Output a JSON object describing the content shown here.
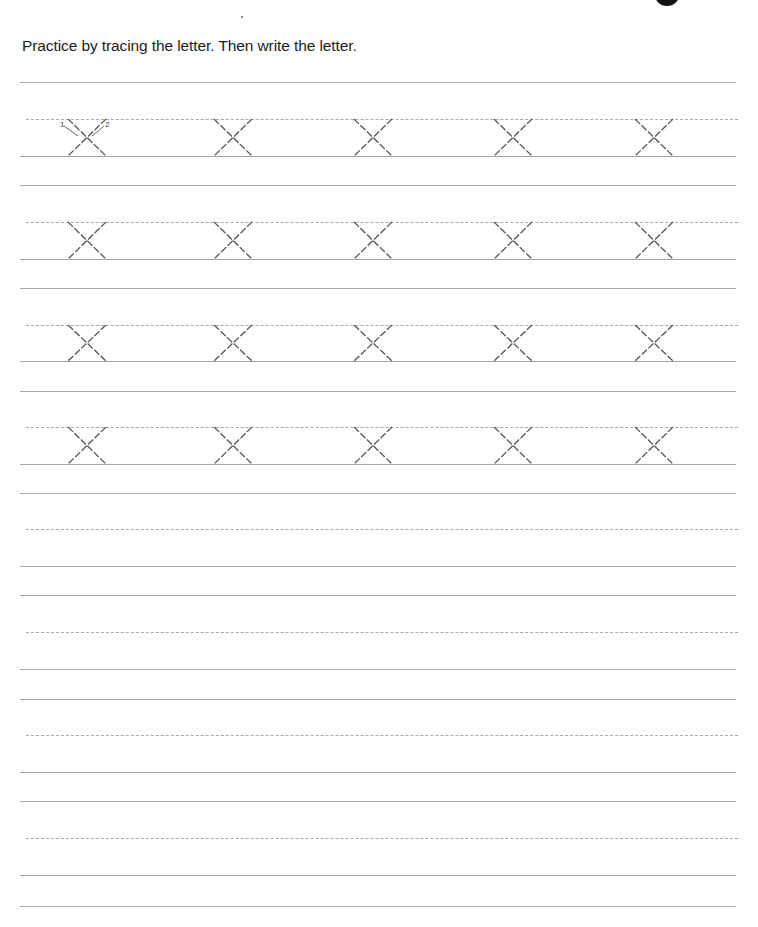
{
  "worksheet": {
    "instruction": "Practice by tracing the letter. Then write the letter.",
    "letter": "x",
    "stroke_numbers": [
      "1",
      "2"
    ],
    "trace_rows": 4,
    "letters_per_row": 5,
    "blank_rows": 4
  },
  "colors": {
    "text": "#1c1c1c",
    "rule_lines": "#a6a6a6",
    "trace_strokes": "#555555"
  }
}
